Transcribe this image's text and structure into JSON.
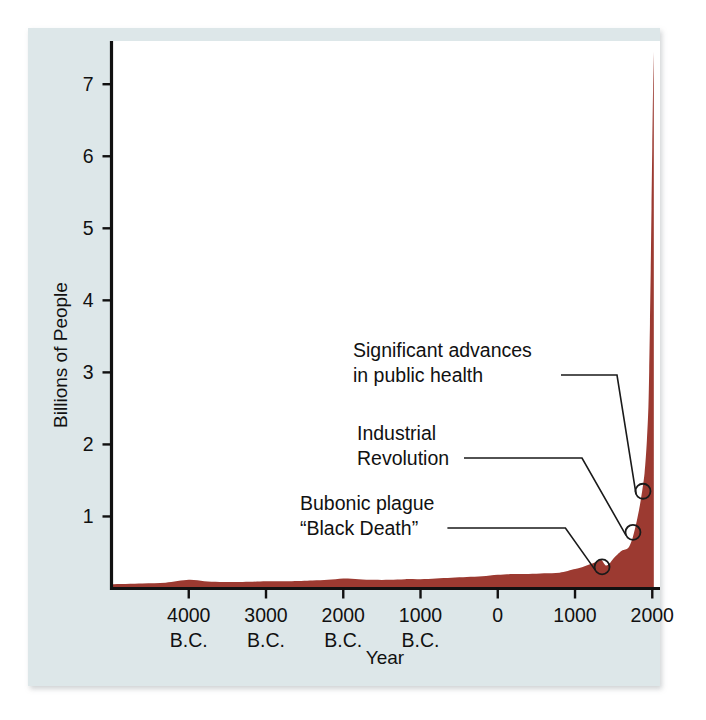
{
  "figure": {
    "background_color": "#ffffff",
    "panel_color": "#dde7e9",
    "series_color": "#9c3a31",
    "axis_color": "#111111"
  },
  "chart_data": {
    "type": "area",
    "title": "",
    "xlabel": "Year",
    "ylabel": "Billions of People",
    "grid": false,
    "legend": null,
    "xlim": [
      -5000,
      2100
    ],
    "ylim": [
      0,
      7.6
    ],
    "x_tick_values": [
      -4000,
      -3000,
      -2000,
      -1000,
      0,
      1000,
      2000
    ],
    "x_tick_labels": [
      "4000",
      "3000",
      "2000",
      "1000",
      "0",
      "1000",
      "2000"
    ],
    "x_tick_sublabels": [
      "B.C.",
      "B.C.",
      "B.C.",
      "B.C.",
      "",
      "",
      ""
    ],
    "y_tick_values": [
      1,
      2,
      3,
      4,
      5,
      6,
      7
    ],
    "y_tick_labels": [
      "1",
      "2",
      "3",
      "4",
      "5",
      "6",
      "7"
    ],
    "series": [
      {
        "name": "World population",
        "color": "#9c3a31",
        "x": [
          -5000,
          -4600,
          -4300,
          -4000,
          -3800,
          -3600,
          -3300,
          -3000,
          -2700,
          -2400,
          -2200,
          -2000,
          -1800,
          -1600,
          -1400,
          -1200,
          -1000,
          -800,
          -600,
          -400,
          -200,
          0,
          200,
          400,
          600,
          800,
          1000,
          1100,
          1200,
          1300,
          1340,
          1400,
          1450,
          1500,
          1600,
          1650,
          1700,
          1750,
          1800,
          1850,
          1900,
          1930,
          1950,
          1960,
          1970,
          1980,
          1990,
          2000,
          2010,
          2020
        ],
        "y": [
          0.06,
          0.07,
          0.08,
          0.12,
          0.1,
          0.09,
          0.09,
          0.1,
          0.1,
          0.11,
          0.12,
          0.14,
          0.13,
          0.12,
          0.12,
          0.13,
          0.13,
          0.14,
          0.15,
          0.16,
          0.17,
          0.19,
          0.2,
          0.2,
          0.21,
          0.22,
          0.27,
          0.3,
          0.34,
          0.38,
          0.4,
          0.32,
          0.35,
          0.42,
          0.52,
          0.54,
          0.58,
          0.72,
          0.94,
          1.22,
          1.6,
          2.05,
          2.52,
          3.02,
          3.68,
          4.43,
          5.28,
          6.12,
          6.92,
          7.45
        ],
        "notes": "Hunter-gatherer baseline, slow agrarian rise, Black Death dip near 1350, exponential modern growth"
      }
    ],
    "annotations": [
      {
        "id": "bubonic-plague",
        "label_lines": [
          "Bubonic plague",
          "“Black Death”"
        ],
        "point_year": 1350,
        "point_value": 0.3,
        "text_x": 300,
        "text_y": 510
      },
      {
        "id": "industrial-revolution",
        "label_lines": [
          "Industrial",
          "Revolution"
        ],
        "point_year": 1750,
        "point_value": 0.78,
        "text_x": 357,
        "text_y": 440
      },
      {
        "id": "public-health",
        "label_lines": [
          "Significant advances",
          "in public health"
        ],
        "point_year": 1880,
        "point_value": 1.35,
        "text_x": 353,
        "text_y": 357
      }
    ]
  }
}
